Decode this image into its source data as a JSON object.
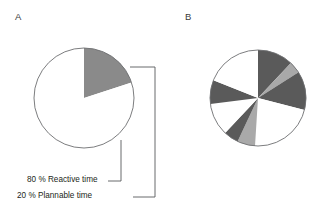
{
  "figure": {
    "background_color": "#ffffff",
    "panels": [
      {
        "letter": "A",
        "name": "panel-a"
      },
      {
        "letter": "B",
        "name": "panel-b"
      }
    ]
  },
  "colors": {
    "outline": "#6d6e71",
    "mid_gray_fill": "#8a8a8a",
    "dark_gray_fill": "#5a5a5a",
    "light_gray_fill": "#a9a9a9",
    "white_fill": "#ffffff",
    "text": "#231f20",
    "leader_line": "#58595b"
  },
  "callouts": {
    "reactive": {
      "label": "80 % Reactive time",
      "percent": 80,
      "series_name": "Reactive time"
    },
    "plannable": {
      "label": "20 % Plannable time",
      "percent": 20,
      "series_name": "Plannable time"
    }
  },
  "chart_data": [
    {
      "type": "pie",
      "name": "panel-a-pie",
      "title": "A",
      "center": [
        84,
        98
      ],
      "radius": 50,
      "start_angle_deg": -90,
      "direction": "clockwise",
      "categories": [
        "Plannable time",
        "Reactive time"
      ],
      "values": [
        20,
        80
      ],
      "value_unit": "%",
      "slice_colors": [
        "#8a8a8a",
        "#ffffff"
      ],
      "labels": [
        "20 % Plannable time",
        "80 % Reactive time"
      ],
      "legend": "none",
      "grid": false,
      "annotations": [
        "20 % Plannable time",
        "80 % Reactive time"
      ]
    },
    {
      "type": "pie",
      "name": "panel-b-pie",
      "title": "B",
      "center": [
        258,
        98
      ],
      "radius": 48,
      "start_angle_deg": -90,
      "direction": "clockwise",
      "categories": [
        "segment-1",
        "segment-2",
        "segment-3",
        "segment-4",
        "segment-5",
        "segment-6",
        "segment-7",
        "segment-8",
        "segment-9",
        "segment-10"
      ],
      "values": [
        12,
        4,
        13,
        22,
        6,
        5,
        11,
        8,
        13,
        6
      ],
      "value_unit": "%",
      "slice_colors": [
        "#5a5a5a",
        "#a9a9a9",
        "#5a5a5a",
        "#ffffff",
        "#a9a9a9",
        "#5a5a5a",
        "#ffffff",
        "#5a5a5a",
        "#ffffff",
        "#ffffff"
      ],
      "legend": "none",
      "grid": false,
      "labels": []
    }
  ]
}
